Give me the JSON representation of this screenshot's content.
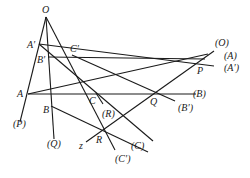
{
  "diagram": {
    "points": {
      "O": {
        "label": "O",
        "x": 46,
        "y": 17
      },
      "A1": {
        "label": "A′",
        "x": 39,
        "y": 44
      },
      "B1": {
        "label": "B′",
        "x": 48,
        "y": 57
      },
      "C1": {
        "label": "C′",
        "x": 72,
        "y": 55
      },
      "A": {
        "label": "A",
        "x": 28,
        "y": 94
      },
      "B": {
        "label": "B",
        "x": 51,
        "y": 106
      },
      "C": {
        "label": "C",
        "x": 96,
        "y": 93
      },
      "P": {
        "label": "P",
        "x": 200,
        "y": 62
      },
      "Q": {
        "label": "Q",
        "x": 155,
        "y": 93
      },
      "R": {
        "label": "R",
        "x": 101,
        "y": 131
      }
    },
    "far_labels": {
      "O_far": "(O)",
      "A_far": "(A)",
      "A1_far": "(A′)",
      "B_far": "(B)",
      "B1_far": "(B′)",
      "C_far": "(C)",
      "C1_far": "(C′)",
      "P_far": "(P)",
      "Q_far": "(Q)",
      "R_far": "(R)",
      "z": "z"
    }
  }
}
